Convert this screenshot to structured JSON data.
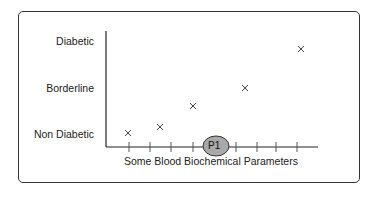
{
  "diagram": {
    "y_labels": [
      "Diabetic",
      "Borderline",
      "Non Diabetic"
    ],
    "x_label": "Some Blood Biochemical Parameters",
    "highlight_label": "P1",
    "highlight_color": "#a9a9a9",
    "marker": "x",
    "points": [
      {
        "x": 128,
        "y": 133
      },
      {
        "x": 160,
        "y": 127
      },
      {
        "x": 193,
        "y": 106
      },
      {
        "x": 245,
        "y": 88
      },
      {
        "x": 301,
        "y": 49
      }
    ]
  }
}
